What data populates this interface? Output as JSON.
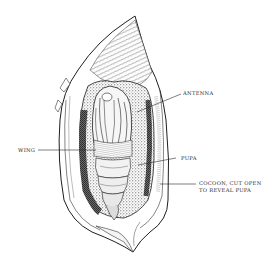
{
  "figure": {
    "ink_color": "#1e1e1e",
    "paper_color": "#ffffff",
    "shading_color": "#3a3a3a"
  },
  "labels": [
    {
      "id": "antenna",
      "text": "ANTENNA",
      "x": 183,
      "y": 90,
      "leader": {
        "x1": 181,
        "y1": 94,
        "x2": 137,
        "y2": 112
      }
    },
    {
      "id": "wing",
      "text": "WING",
      "x": 18,
      "y": 147,
      "leader": {
        "x1": 38,
        "y1": 150,
        "x2": 96,
        "y2": 150
      }
    },
    {
      "id": "pupa",
      "text": "PUPA",
      "x": 181,
      "y": 155,
      "leader": {
        "x1": 176,
        "y1": 158,
        "x2": 138,
        "y2": 165
      }
    },
    {
      "id": "cocoon",
      "text_lines": [
        "COCOON, CUT OPEN",
        "TO REVEAL PUPA"
      ],
      "x": 199,
      "y": 180,
      "leader": {
        "x1": 196,
        "y1": 184,
        "x2": 160,
        "y2": 184
      }
    }
  ]
}
